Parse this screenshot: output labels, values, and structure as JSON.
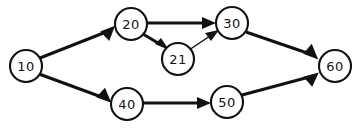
{
  "diagram": {
    "type": "directed-graph",
    "title": "",
    "background_color": "#ffffff",
    "stroke_color": "#111111",
    "canvas": {
      "width": 362,
      "height": 129
    },
    "nodes": [
      {
        "id": "n10",
        "label": "10",
        "cx": 26,
        "cy": 66,
        "r": 16
      },
      {
        "id": "n20",
        "label": "20",
        "cx": 131,
        "cy": 24,
        "r": 16
      },
      {
        "id": "n21",
        "label": "21",
        "cx": 178,
        "cy": 59,
        "r": 16
      },
      {
        "id": "n30",
        "label": "30",
        "cx": 232,
        "cy": 23,
        "r": 16
      },
      {
        "id": "n40",
        "label": "40",
        "cx": 127,
        "cy": 104,
        "r": 16
      },
      {
        "id": "n50",
        "label": "50",
        "cx": 227,
        "cy": 102,
        "r": 16
      },
      {
        "id": "n60",
        "label": "60",
        "cx": 335,
        "cy": 66,
        "r": 16
      }
    ],
    "edges": [
      {
        "id": "e10-20",
        "from": "10",
        "to": "20",
        "weight": "thick",
        "label": ""
      },
      {
        "id": "e10-40",
        "from": "10",
        "to": "40",
        "weight": "thick",
        "label": ""
      },
      {
        "id": "e20-30",
        "from": "20",
        "to": "30",
        "weight": "thick",
        "label": ""
      },
      {
        "id": "e20-21",
        "from": "20",
        "to": "21",
        "weight": "thick",
        "label": ""
      },
      {
        "id": "e21-30",
        "from": "21",
        "to": "30",
        "weight": "thin",
        "label": ""
      },
      {
        "id": "e30-60",
        "from": "30",
        "to": "60",
        "weight": "thick",
        "label": ""
      },
      {
        "id": "e40-50",
        "from": "40",
        "to": "50",
        "weight": "thick",
        "label": ""
      },
      {
        "id": "e50-60",
        "from": "50",
        "to": "60",
        "weight": "thick",
        "label": ""
      }
    ]
  }
}
